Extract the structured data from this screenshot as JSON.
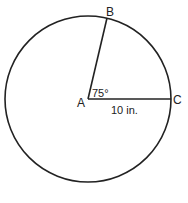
{
  "diagram": {
    "type": "circle-sector",
    "center_label": "A",
    "point_b_label": "B",
    "point_c_label": "C",
    "angle_label": "75°",
    "radius_label": "10 in.",
    "angle_degrees": 75,
    "radius_value": 10,
    "radius_unit": "in.",
    "stroke_color": "#222222",
    "background_color": "#ffffff"
  }
}
